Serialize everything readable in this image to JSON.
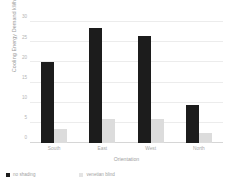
{
  "chart_data": {
    "type": "bar",
    "title": "",
    "xlabel": "Orientation",
    "ylabel": "Cooling Energy Demand",
    "ylabel_unit": "kWh/m2y",
    "categories": [
      "South",
      "East",
      "West",
      "North"
    ],
    "series": [
      {
        "name": "no shading",
        "color": "#1c1c1c",
        "values": [
          20,
          28.5,
          26.5,
          9.5
        ]
      },
      {
        "name": "venetian blind",
        "color": "#dcdcdc",
        "values": [
          3.5,
          6,
          6,
          2.5
        ]
      }
    ],
    "ylim": [
      0,
      30
    ],
    "yticks": [
      0,
      5,
      10,
      15,
      20,
      25,
      30
    ],
    "ytick_labels": [
      "0",
      "5",
      "10",
      "15",
      "20",
      "25",
      "30"
    ],
    "grid": true,
    "legend_position": "bottom-left"
  }
}
